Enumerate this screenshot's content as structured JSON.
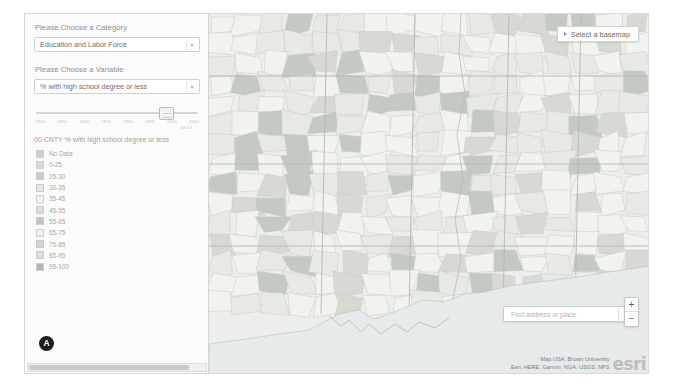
{
  "sidebar": {
    "category_label": "Please Choose a Category",
    "category_value": "Education and Labor Force",
    "variable_label": "Please Choose a Variable",
    "variable_value": "% with high school degree or less",
    "slider": {
      "ticks": [
        "1940",
        "1950",
        "1960",
        "1970",
        "1980",
        "1990",
        "2000",
        "2010"
      ],
      "sub_label": "08-12",
      "handle_year": "2000"
    },
    "legend": {
      "title": "00 CNTY % with high school degree or less",
      "items": [
        {
          "label": "No Data",
          "color": "#cfcfcf"
        },
        {
          "label": "0-25",
          "color": "#d7d9d4"
        },
        {
          "label": "25-30",
          "color": "#c9cdc6"
        },
        {
          "label": "30-35",
          "color": "#e3e5e0"
        },
        {
          "label": "35-45",
          "color": "#f3f4f1"
        },
        {
          "label": "45-55",
          "color": "#dcdfd8"
        },
        {
          "label": "55-65",
          "color": "#c3c8bf"
        },
        {
          "label": "65-75",
          "color": "#f0f1ee"
        },
        {
          "label": "75-85",
          "color": "#d2d5ce"
        },
        {
          "label": "85-95",
          "color": "#dddfd9"
        },
        {
          "label": "95-100",
          "color": "#b4b9b0"
        }
      ]
    },
    "marker_label": "A"
  },
  "map": {
    "basemap_button": "Select a basemap",
    "search_placeholder": "Find address or place",
    "search_icon": "search-icon",
    "zoom_in": "+",
    "zoom_out": "−",
    "attribution_line1": "Map USA, Brown University",
    "attribution_line2": "Esri, HERE, Garmin, NGA, USGS, NPS",
    "logo_text": "esri"
  }
}
